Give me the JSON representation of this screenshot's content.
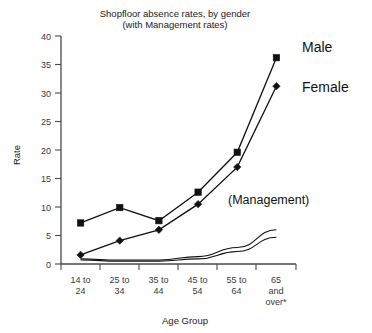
{
  "chart_data": {
    "type": "line",
    "title": "Shopfloor absence rates, by gender",
    "subtitle": "(with Management rates)",
    "xlabel": "Age Group",
    "ylabel": "Rate",
    "categories": [
      "14 to 24",
      "25 to 34",
      "35 to 44",
      "45 to 54",
      "55 to 64",
      "65 and over*"
    ],
    "category_lines": [
      [
        "14 to",
        "24"
      ],
      [
        "25 to",
        "34"
      ],
      [
        "35 to",
        "44"
      ],
      [
        "45 to",
        "54"
      ],
      [
        "55 to",
        "64"
      ],
      [
        "65",
        "and",
        "over*"
      ]
    ],
    "ylim": [
      0,
      40
    ],
    "yticks": [
      0,
      5,
      10,
      15,
      20,
      25,
      30,
      35,
      40
    ],
    "ytick_labels": [
      "0",
      "5",
      "10",
      "15",
      "20",
      "25",
      "30",
      "35",
      "40"
    ],
    "grid": false,
    "legend_position": "inline-right",
    "series": [
      {
        "name": "Male",
        "marker": "square",
        "values": [
          7.2,
          9.9,
          7.6,
          12.6,
          19.6,
          36.2
        ]
      },
      {
        "name": "Female",
        "marker": "diamond",
        "values": [
          1.6,
          4.1,
          6.0,
          10.5,
          17.0,
          31.2
        ]
      },
      {
        "name": "Management male",
        "marker": "none",
        "values": [
          0.9,
          0.7,
          0.7,
          1.3,
          2.9,
          6.0
        ]
      },
      {
        "name": "Management female",
        "marker": "none",
        "values": [
          0.7,
          0.5,
          0.5,
          0.9,
          2.2,
          4.7
        ]
      }
    ],
    "annotations": [
      {
        "text": "(Management)",
        "x_category_index": 4,
        "y_value": 11.5
      }
    ],
    "colors": {
      "line": "#111111",
      "axis": "#4a4a4a",
      "text": "#1a1a1a",
      "background": "#ffffff"
    }
  }
}
